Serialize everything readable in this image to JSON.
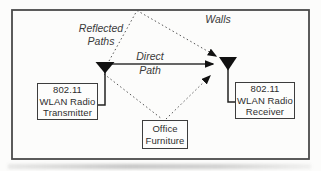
{
  "diagram": {
    "title_implied": "802.11 WLAN multipath propagation",
    "nodes": {
      "transmitter": {
        "line1": "802.11",
        "line2": "WLAN Radio",
        "line3": "Transmitter"
      },
      "receiver": {
        "line1": "802.11",
        "line2": "WLAN Radio",
        "line3": "Receiver"
      },
      "furniture": {
        "line1": "Office",
        "line2": "Furniture"
      }
    },
    "labels": {
      "reflected_paths": "Reflected\nPaths",
      "direct_path": "Direct\nPath",
      "walls": "Walls"
    },
    "colors": {
      "line": "#3a3a3a",
      "dotted": "#555555",
      "fill": "#111111",
      "box_border": "#3d3d3d",
      "background": "#fcfcfb"
    }
  }
}
